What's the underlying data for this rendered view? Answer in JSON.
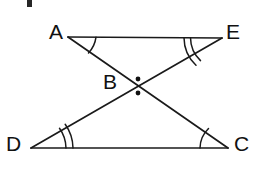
{
  "figure": {
    "background_color": "#ffffff",
    "stroke_color": "#1a1a1a",
    "label_color": "#111111"
  },
  "labels": {
    "A": "A",
    "B": "B",
    "C": "C",
    "D": "D",
    "E": "E"
  },
  "points": {
    "A": {
      "x": 68,
      "y": 37
    },
    "E": {
      "x": 222,
      "y": 38
    },
    "B": {
      "x": 136,
      "y": 86
    },
    "D": {
      "x": 31,
      "y": 148
    },
    "C": {
      "x": 228,
      "y": 148
    }
  },
  "segments": [
    {
      "name": "AE",
      "from": "A",
      "to": "E"
    },
    {
      "name": "DC",
      "from": "D",
      "to": "C"
    },
    {
      "name": "AC",
      "from": "A",
      "to": "C"
    },
    {
      "name": "DE",
      "from": "D",
      "to": "E"
    }
  ],
  "angle_marks": [
    {
      "vertex": "A",
      "arcs": 1
    },
    {
      "vertex": "E",
      "arcs": 2
    },
    {
      "vertex": "D",
      "arcs": 2
    },
    {
      "vertex": "C",
      "arcs": 1
    }
  ],
  "intersection_dots": [
    {
      "name": "dot-above-B",
      "x": 138,
      "y": 79
    },
    {
      "name": "dot-below-B",
      "x": 138,
      "y": 93
    }
  ],
  "artifact": {
    "name": "edge-scan-artifact",
    "color": "#262626"
  }
}
